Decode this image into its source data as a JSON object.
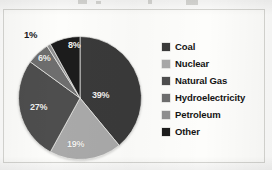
{
  "chart_data": {
    "type": "pie",
    "title": "",
    "xlabel": "",
    "ylabel": "",
    "legend_position": "right",
    "grid": false,
    "units": "%",
    "categories": [
      "Coal",
      "Nuclear",
      "Natural Gas",
      "Hydroelectricity",
      "Petroleum",
      "Other"
    ],
    "values": [
      39,
      19,
      27,
      6,
      1,
      8
    ],
    "labels": [
      "39%",
      "19%",
      "27%",
      "6%",
      "1%",
      "8%"
    ],
    "colors": [
      "#3a3a3a",
      "#a9a9a9",
      "#4e4e4e",
      "#6e6e6e",
      "#8f8f8f",
      "#1c1c1c"
    ],
    "label_positions": [
      "inside",
      "inside",
      "inside",
      "inside",
      "outside",
      "inside"
    ],
    "slices": [
      {
        "name": "Coal",
        "value": 39,
        "label": "39%",
        "color": "#3a3a3a",
        "start_angle": 0,
        "end_angle": 140.4,
        "label_placement": "inside"
      },
      {
        "name": "Nuclear",
        "value": 19,
        "label": "19%",
        "color": "#a9a9a9",
        "start_angle": 140.4,
        "end_angle": 208.8,
        "label_placement": "inside"
      },
      {
        "name": "Natural Gas",
        "value": 27,
        "label": "27%",
        "color": "#4e4e4e",
        "start_angle": 208.8,
        "end_angle": 306.0,
        "label_placement": "inside"
      },
      {
        "name": "Hydroelectricity",
        "value": 6,
        "label": "6%",
        "color": "#6e6e6e",
        "start_angle": 306.0,
        "end_angle": 327.6,
        "label_placement": "inside"
      },
      {
        "name": "Petroleum",
        "value": 1,
        "label": "1%",
        "color": "#8f8f8f",
        "start_angle": 327.6,
        "end_angle": 331.2,
        "label_placement": "outside"
      },
      {
        "name": "Other",
        "value": 8,
        "label": "8%",
        "color": "#1c1c1c",
        "start_angle": 331.2,
        "end_angle": 360.0,
        "label_placement": "inside"
      }
    ]
  },
  "legend": {
    "items": [
      {
        "label": "Coal",
        "color": "#3a3a3a"
      },
      {
        "label": "Nuclear",
        "color": "#a9a9a9"
      },
      {
        "label": "Natural Gas",
        "color": "#4e4e4e"
      },
      {
        "label": "Hydroelectricity",
        "color": "#6e6e6e"
      },
      {
        "label": "Petroleum",
        "color": "#8f8f8f"
      },
      {
        "label": "Other",
        "color": "#1c1c1c"
      }
    ]
  },
  "style": {
    "background": "#fdfdfb",
    "border_color": "#d6d6d2",
    "inside_label_color": "#f2f2f0",
    "outside_label_color": "#1b1b1b"
  }
}
